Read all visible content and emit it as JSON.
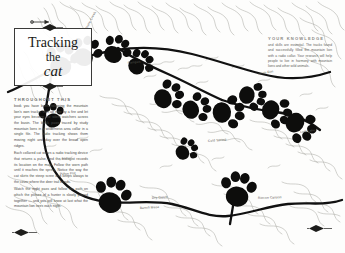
{
  "page": {
    "background_color": "#fdfdfc",
    "ink_color": "#181816",
    "trail_color": "#111111",
    "contour_color": "#9a9a94"
  },
  "title_card": {
    "line1": "Tracking",
    "line2": "the",
    "line3": "cat",
    "ornament_top": "diamond-ornament",
    "ornament_bottom": "diamond-ornament"
  },
  "left_text": {
    "kicker": "THROUGHOUT THIS",
    "paragraphs": [
      "book you have been following the mountain lion's own tracks. Curl up now by a fire and let your eyes become the silent watchers across the basin. The black paws traced by study mountain lions in a wilderness area collar in a single file. The radio tracking shows them moving night and day over the broad open ridges.",
      "Each collared cat wears a radio tracking device that returns a pulse, and the biologist records its location on the map. Follow the worn path until it reaches the spring. Notice the way the cat skirts the steep scree and keeps always to the cover where the deer trail bends.",
      "Watch the night pass and follow the path on which the picture of a hunter is slowly pieced together — and you will know at last what the mountain lion sees each night."
    ]
  },
  "right_text": {
    "kicker": "YOUR KNOWLEDGE",
    "paragraphs": [
      "and skills are essential. The tracks found and successfully filled the mountain lion with a radio collar. Your research will help people to live in harmony with mountain lions and other wild animals."
    ]
  },
  "map_labels": [
    {
      "text": "Pampas",
      "x": 128,
      "y": 61,
      "rotate": -6
    },
    {
      "text": "Stone Creek",
      "x": 86,
      "y": 27,
      "rotate": -62
    },
    {
      "text": "Dry Gulch",
      "x": 152,
      "y": 196,
      "rotate": -4
    },
    {
      "text": "Bench Mesa",
      "x": 140,
      "y": 206,
      "rotate": -3
    },
    {
      "text": "Rincon Canyon",
      "x": 258,
      "y": 196,
      "rotate": -2
    },
    {
      "text": "Cold Spring",
      "x": 208,
      "y": 139,
      "rotate": -5
    },
    {
      "text": "North Rim",
      "x": 258,
      "y": 72,
      "rotate": -10
    },
    {
      "text": "Piñon Flat",
      "x": 60,
      "y": 172,
      "rotate": -3
    },
    {
      "text": "Lost Lake",
      "x": 300,
      "y": 130,
      "rotate": -8
    }
  ],
  "paw_prints": [
    {
      "id": "paw-01",
      "x": 62,
      "y": 60,
      "scale": 1.15,
      "rotate": 12
    },
    {
      "id": "paw-02",
      "x": 86,
      "y": 52,
      "scale": 1.05,
      "rotate": 26
    },
    {
      "id": "paw-03",
      "x": 116,
      "y": 50,
      "scale": 1.0,
      "rotate": 34
    },
    {
      "id": "paw-04",
      "x": 140,
      "y": 63,
      "scale": 0.92,
      "rotate": 48
    },
    {
      "id": "paw-05",
      "x": 168,
      "y": 96,
      "scale": 1.05,
      "rotate": 62
    },
    {
      "id": "paw-06",
      "x": 196,
      "y": 108,
      "scale": 1.0,
      "rotate": 72
    },
    {
      "id": "paw-07",
      "x": 228,
      "y": 112,
      "scale": 1.12,
      "rotate": 86
    },
    {
      "id": "paw-08",
      "x": 252,
      "y": 96,
      "scale": 0.95,
      "rotate": 100
    },
    {
      "id": "paw-09",
      "x": 276,
      "y": 112,
      "scale": 1.05,
      "rotate": 112
    },
    {
      "id": "paw-10",
      "x": 300,
      "y": 126,
      "scale": 1.1,
      "rotate": 124
    },
    {
      "id": "paw-11",
      "x": 112,
      "y": 196,
      "scale": 1.25,
      "rotate": 16
    },
    {
      "id": "paw-12",
      "x": 238,
      "y": 190,
      "scale": 1.22,
      "rotate": 8
    },
    {
      "id": "paw-13",
      "x": 52,
      "y": 116,
      "scale": 0.85,
      "rotate": -14
    },
    {
      "id": "paw-14",
      "x": 186,
      "y": 150,
      "scale": 0.8,
      "rotate": 54
    }
  ],
  "arrow_marker": {
    "name": "north-arrow",
    "x": 40,
    "y": 22
  }
}
